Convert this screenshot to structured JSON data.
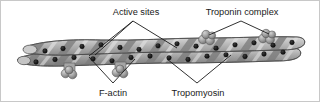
{
  "figure": {
    "background_color": "#ffffff",
    "border_color": "#c8c8c8",
    "width": 320,
    "height": 102
  },
  "labels": {
    "active_sites": "Active sites",
    "troponin_complex": "Troponin complex",
    "f_actin": "F-actin",
    "tropomyosin": "Tropomyosin"
  },
  "colors": {
    "actin_light": "#c9c9c9",
    "actin_mid": "#a8a8a8",
    "actin_dark": "#7d7d7d",
    "tropomyosin_band": "#8c8c8c",
    "troponin_sphere": "#9e9e9e",
    "troponin_sphere_dark": "#7a7a7a",
    "outline": "#4a4a4a",
    "active_site_dot": "#111111",
    "leader_line": "#1a1a1a",
    "text": "#1a1a1a"
  },
  "structure": {
    "filament_type": "double helix of globular actin monomers",
    "active_site_count": 26,
    "troponin_complex_count": 4,
    "troponin_positions": [
      "upper-left-lower",
      "upper-mid-lower",
      "upper-right-a",
      "upper-right-b"
    ],
    "active_site_dots_upper": [
      {
        "x": 44,
        "y": 50
      },
      {
        "x": 62,
        "y": 47
      },
      {
        "x": 80,
        "y": 45
      },
      {
        "x": 99,
        "y": 43
      },
      {
        "x": 118,
        "y": 45
      },
      {
        "x": 137,
        "y": 47
      },
      {
        "x": 156,
        "y": 44
      },
      {
        "x": 175,
        "y": 42
      },
      {
        "x": 194,
        "y": 44
      },
      {
        "x": 213,
        "y": 46
      },
      {
        "x": 232,
        "y": 43
      },
      {
        "x": 251,
        "y": 41
      },
      {
        "x": 270,
        "y": 43
      },
      {
        "x": 289,
        "y": 41
      }
    ],
    "active_site_dots_lower": [
      {
        "x": 35,
        "y": 60
      },
      {
        "x": 54,
        "y": 58
      },
      {
        "x": 73,
        "y": 56
      },
      {
        "x": 92,
        "y": 57
      },
      {
        "x": 111,
        "y": 59
      },
      {
        "x": 130,
        "y": 56
      },
      {
        "x": 149,
        "y": 55
      },
      {
        "x": 168,
        "y": 56
      },
      {
        "x": 187,
        "y": 58
      },
      {
        "x": 206,
        "y": 55
      },
      {
        "x": 225,
        "y": 54
      },
      {
        "x": 244,
        "y": 55
      }
    ]
  }
}
